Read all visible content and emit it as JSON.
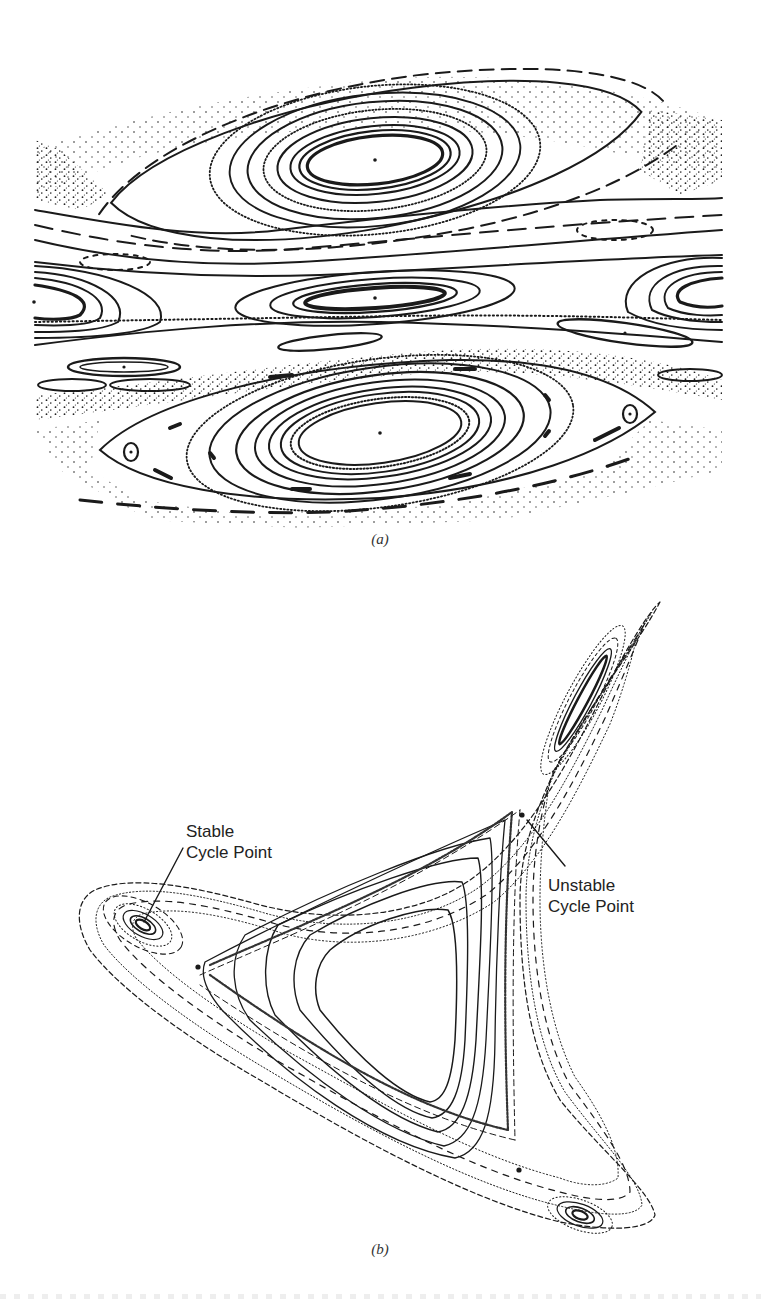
{
  "figure": {
    "panels": [
      {
        "id": "a",
        "caption": "(a)",
        "description": "Surface-of-section showing nested invariant curves around central elliptic points, chains of secondary islands, and chaotic separatrix layers (scattered dots)",
        "features": {
          "primary_islands": [
            {
              "name": "upper-island",
              "center": [
                375,
                160
              ]
            },
            {
              "name": "lower-island",
              "center": [
                380,
                433
              ]
            },
            {
              "name": "middle-island",
              "center": [
                375,
                298
              ]
            },
            {
              "name": "left-edge-island",
              "center": [
                34,
                302
              ]
            },
            {
              "name": "right-edge-island",
              "center": [
                716,
                290
              ]
            }
          ],
          "small_islands_with_points": [
            {
              "name": "left-triangle-island",
              "center": [
                131,
                452
              ]
            },
            {
              "name": "right-triangle-island",
              "center": [
                630,
                414
              ]
            },
            {
              "name": "left-band-island",
              "center": [
                124,
                367
              ]
            },
            {
              "name": "right-band-island",
              "center": [
                625,
                333
              ]
            }
          ]
        }
      },
      {
        "id": "b",
        "caption": "(b)",
        "description": "Three-armed phase-space portrait with nested curves around a central triangular region; elliptic islands at the tips of each arm",
        "annotations": [
          {
            "name": "stable-cycle-point",
            "text": "Stable\nCycle Point",
            "line1": "Stable",
            "line2": "Cycle Point",
            "point": [
              143,
              925
            ]
          },
          {
            "name": "unstable-cycle-point",
            "text": "Unstable\nCycle Point",
            "line1": "Unstable",
            "line2": "Cycle Point",
            "point": [
              522,
              815
            ]
          }
        ],
        "unstable_points": [
          [
            522,
            815
          ],
          [
            198,
            967
          ],
          [
            519,
            1170
          ]
        ],
        "stable_points": [
          [
            143,
            925
          ],
          [
            583,
            700
          ],
          [
            580,
            1215
          ]
        ]
      }
    ]
  },
  "colors": {
    "ink": "#1a1a1a",
    "background": "#ffffff"
  }
}
